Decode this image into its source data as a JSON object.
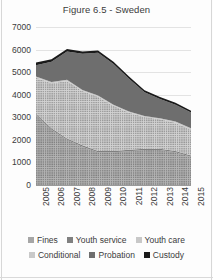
{
  "chart": {
    "title": "Figure 6.5 - Sweden",
    "yticks": [
      "0",
      "1000",
      "2000",
      "3000",
      "4000",
      "5000",
      "6000",
      "7000"
    ],
    "xticks": [
      "2005",
      "2006",
      "2007",
      "2008",
      "2009",
      "2010",
      "2011",
      "2012",
      "2013",
      "2014",
      "2015"
    ]
  },
  "legend": {
    "row1": [
      {
        "label": "Fines",
        "swatch": "sw-fines",
        "icon": "square-dotted-swatch-icon"
      },
      {
        "label": "Youth service",
        "swatch": "sw-youthservice",
        "icon": "square-solid-swatch-icon"
      },
      {
        "label": "Youth care",
        "swatch": "sw-youthcare",
        "icon": "square-dotted-swatch-icon"
      }
    ],
    "row2": [
      {
        "label": "Conditional",
        "swatch": "sw-conditional",
        "icon": "square-solid-swatch-icon"
      },
      {
        "label": "Probation",
        "swatch": "sw-probation",
        "icon": "square-solid-swatch-icon"
      },
      {
        "label": "Custody",
        "swatch": "sw-custody",
        "icon": "square-solid-swatch-icon"
      }
    ]
  },
  "chart_data": {
    "type": "area",
    "stacked": true,
    "title": "Figure 6.5 - Sweden",
    "xlabel": "",
    "ylabel": "",
    "ylim": [
      0,
      7000
    ],
    "ytick_step": 1000,
    "grid": true,
    "legend_position": "bottom",
    "categories": [
      "2005",
      "2006",
      "2007",
      "2008",
      "2009",
      "2010",
      "2011",
      "2012",
      "2013",
      "2014",
      "2015"
    ],
    "series": [
      {
        "name": "Fines",
        "color": "#a6a6a6",
        "pattern": "dotted",
        "values": [
          3100,
          2450,
          2000,
          1700,
          1450,
          1450,
          1500,
          1550,
          1550,
          1450,
          1250
        ]
      },
      {
        "name": "Youth service",
        "color": "#808080",
        "pattern": "solid",
        "values": [
          60,
          60,
          60,
          60,
          60,
          60,
          60,
          60,
          60,
          60,
          60
        ]
      },
      {
        "name": "Youth care",
        "color": "#c8c8c8",
        "pattern": "dotted",
        "values": [
          1600,
          2000,
          2550,
          2400,
          2400,
          2000,
          1650,
          1400,
          1300,
          1250,
          1150
        ]
      },
      {
        "name": "Conditional",
        "color": "#c9c9c9",
        "pattern": "solid",
        "values": [
          50,
          50,
          50,
          50,
          50,
          50,
          50,
          50,
          50,
          50,
          50
        ]
      },
      {
        "name": "Probation",
        "color": "#6e6e6e",
        "pattern": "solid",
        "values": [
          500,
          900,
          1250,
          1600,
          1900,
          1800,
          1450,
          1050,
          850,
          750,
          700
        ]
      },
      {
        "name": "Custody",
        "color": "#1a1a1a",
        "pattern": "solid",
        "values": [
          120,
          110,
          110,
          100,
          100,
          95,
          95,
          90,
          90,
          85,
          85
        ]
      }
    ],
    "totals": [
      5430,
      5570,
      6020,
      5910,
      5960,
      5455,
      4805,
      4200,
      3900,
      3645,
      3295
    ]
  }
}
